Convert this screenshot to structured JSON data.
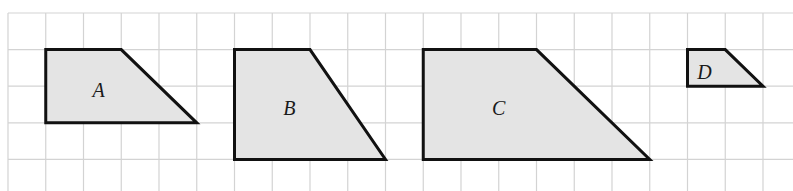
{
  "grid": {
    "origin_x": 8,
    "origin_y": 13,
    "cell_w": 37.75,
    "cell_h": 36.6,
    "cols": 21,
    "rows": 5,
    "line_color": "#d3d3d3"
  },
  "colors": {
    "fill": "#e4e4e4",
    "stroke": "#111111"
  },
  "shapes": [
    {
      "label": "A",
      "vertices": [
        [
          1,
          1
        ],
        [
          3,
          1
        ],
        [
          5,
          3
        ],
        [
          1,
          3
        ]
      ],
      "label_pos": [
        2.4,
        2.1
      ]
    },
    {
      "label": "B",
      "vertices": [
        [
          6,
          1
        ],
        [
          8,
          1
        ],
        [
          10,
          4
        ],
        [
          6,
          4
        ]
      ],
      "label_pos": [
        7.45,
        2.6
      ]
    },
    {
      "label": "C",
      "vertices": [
        [
          11,
          1
        ],
        [
          14,
          1
        ],
        [
          17,
          4
        ],
        [
          11,
          4
        ]
      ],
      "label_pos": [
        13.0,
        2.6
      ]
    },
    {
      "label": "D",
      "vertices": [
        [
          18,
          1
        ],
        [
          19,
          1
        ],
        [
          20,
          2
        ],
        [
          18,
          2
        ]
      ],
      "label_pos": [
        18.45,
        1.6
      ]
    }
  ]
}
